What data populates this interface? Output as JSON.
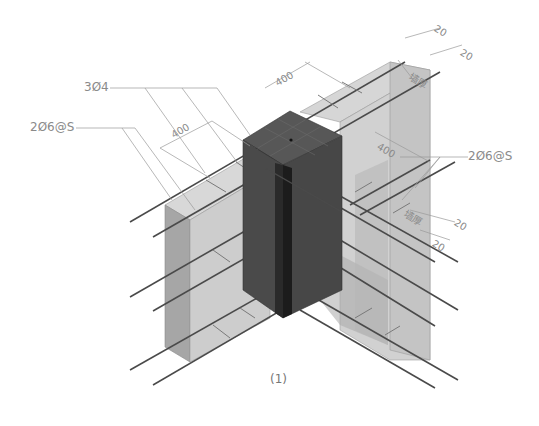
{
  "figure": {
    "caption": "(1)"
  },
  "labels": {
    "main_bars": "3Ø4",
    "tie_bars_left": "2Ø6@S",
    "tie_bars_right": "2Ø6@S"
  },
  "dimensions": {
    "left_spacing": "400",
    "top_spacing": "400",
    "right_spacing": "400",
    "cover_top_1": "20",
    "cover_top_2": "20",
    "cover_mid_1": "20",
    "cover_mid_2": "20",
    "wall_thickness_top": "墙厚",
    "wall_thickness_mid": "墙厚"
  },
  "colors": {
    "column_dark": "#3e3e3e",
    "column_mid": "#4a4a4a",
    "column_top": "#555555",
    "wall_light": "#c9c9c9",
    "wall_side": "#a8a8a8",
    "rebar": "#4a4a4a",
    "leader": "#9a9a9a"
  }
}
